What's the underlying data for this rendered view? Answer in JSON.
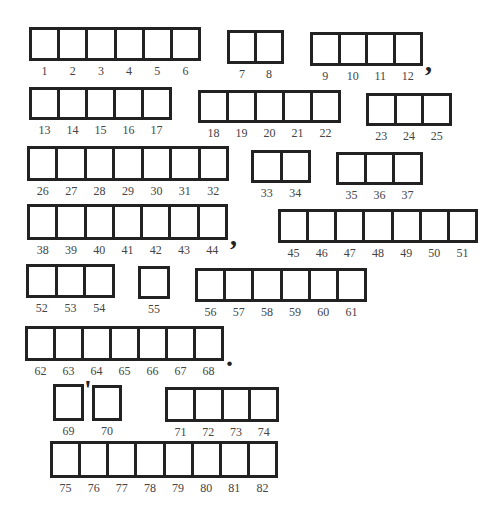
{
  "puzzle": {
    "type": "numbered letter-box phrase puzzle",
    "words": [
      {
        "id": "w1",
        "numbers": [
          "1",
          "2",
          "3",
          "4",
          "5",
          "6"
        ],
        "x": 29,
        "y": 27,
        "w": 172,
        "h": 34
      },
      {
        "id": "w2",
        "numbers": [
          "7",
          "8"
        ],
        "x": 227,
        "y": 30,
        "w": 57,
        "h": 34
      },
      {
        "id": "w3",
        "numbers": [
          "9",
          "10",
          "11",
          "12"
        ],
        "x": 310,
        "y": 32,
        "w": 113,
        "h": 34,
        "punct_after": ","
      },
      {
        "id": "w4",
        "numbers": [
          "13",
          "14",
          "15",
          "16",
          "17"
        ],
        "x": 29,
        "y": 87,
        "w": 143,
        "h": 33
      },
      {
        "id": "w5",
        "numbers": [
          "18",
          "19",
          "20",
          "21",
          "22"
        ],
        "x": 198,
        "y": 90,
        "w": 143,
        "h": 33
      },
      {
        "id": "w6",
        "numbers": [
          "23",
          "24",
          "25"
        ],
        "x": 366,
        "y": 93,
        "w": 86,
        "h": 33
      },
      {
        "id": "w7",
        "numbers": [
          "26",
          "27",
          "28",
          "29",
          "30",
          "31",
          "32"
        ],
        "x": 27,
        "y": 146,
        "w": 202,
        "h": 35
      },
      {
        "id": "w8",
        "numbers": [
          "33",
          "34"
        ],
        "x": 251,
        "y": 150,
        "w": 60,
        "h": 33
      },
      {
        "id": "w9",
        "numbers": [
          "35",
          "36",
          "37"
        ],
        "x": 336,
        "y": 152,
        "w": 87,
        "h": 33
      },
      {
        "id": "w10",
        "numbers": [
          "38",
          "39",
          "40",
          "41",
          "42",
          "43",
          "44"
        ],
        "x": 27,
        "y": 204,
        "w": 201,
        "h": 36,
        "punct_after": ","
      },
      {
        "id": "w11",
        "numbers": [
          "45",
          "46",
          "47",
          "48",
          "49",
          "50",
          "51"
        ],
        "x": 278,
        "y": 209,
        "w": 200,
        "h": 34
      },
      {
        "id": "w12",
        "numbers": [
          "52",
          "53",
          "54"
        ],
        "x": 26,
        "y": 264,
        "w": 89,
        "h": 34
      },
      {
        "id": "w13",
        "numbers": [
          "55"
        ],
        "x": 138,
        "y": 266,
        "w": 32,
        "h": 33
      },
      {
        "id": "w14",
        "numbers": [
          "56",
          "57",
          "58",
          "59",
          "60",
          "61"
        ],
        "x": 195,
        "y": 268,
        "w": 172,
        "h": 34
      },
      {
        "id": "w15",
        "numbers": [
          "62",
          "63",
          "64",
          "65",
          "66",
          "67",
          "68"
        ],
        "x": 25,
        "y": 326,
        "w": 199,
        "h": 35,
        "punct_after": "."
      },
      {
        "id": "w16",
        "numbers": [
          "69"
        ],
        "x": 53,
        "y": 384,
        "w": 31,
        "h": 37,
        "punct_after": "'"
      },
      {
        "id": "w17",
        "numbers": [
          "70"
        ],
        "x": 92,
        "y": 385,
        "w": 30,
        "h": 36
      },
      {
        "id": "w18",
        "numbers": [
          "71",
          "72",
          "73",
          "74"
        ],
        "x": 165,
        "y": 387,
        "w": 114,
        "h": 35
      },
      {
        "id": "w19",
        "numbers": [
          "75",
          "76",
          "77",
          "78",
          "79",
          "80",
          "81",
          "82"
        ],
        "x": 50,
        "y": 441,
        "w": 228,
        "h": 37
      }
    ]
  },
  "colors": {
    "box_border": "#222222",
    "number_text": "#444444",
    "background": "#ffffff"
  }
}
